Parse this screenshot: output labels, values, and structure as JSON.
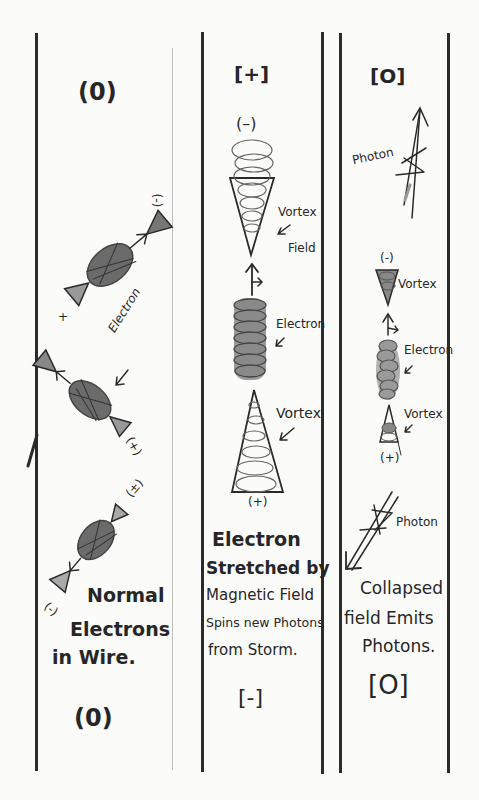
{
  "panels": [
    {
      "id": "normal",
      "top_charge": "(0)",
      "bottom_charge": "(0)",
      "labels": {
        "electron": "Electron",
        "plus_top": "+",
        "minus_top": "(-)",
        "plus_mid": "(+)",
        "plus_bottom": "(±)",
        "minus_bottom": "(-)"
      },
      "caption": [
        "Normal",
        "Electrons",
        "in Wire."
      ]
    },
    {
      "id": "stretched",
      "top_charge": "[+]",
      "bottom_charge": "[-]",
      "labels": {
        "minus_top": "(–)",
        "vortex_field": "Vortex",
        "field": "Field",
        "electron": "Electron",
        "vortex": "Vortex",
        "plus_bottom": "(+)"
      },
      "caption": [
        "Electron",
        "Stretched by",
        "Magnetic Field",
        "Spins new Photons",
        "from Storm."
      ]
    },
    {
      "id": "collapsed",
      "top_charge": "[O]",
      "bottom_charge": "[O]",
      "labels": {
        "photon_top": "Photon",
        "minus_top": "(-)",
        "vortex_top": "Vortex",
        "electron": "Electron",
        "vortex_bottom": "Vortex",
        "plus_bottom": "(+)",
        "photon_bottom": "Photon"
      },
      "caption": [
        "Collapsed",
        "field Emits",
        "Photons."
      ]
    }
  ],
  "colors": {
    "ink": "#2a2a2a",
    "paper": "#fbfbf9",
    "pencil": "#7a7a7a"
  }
}
